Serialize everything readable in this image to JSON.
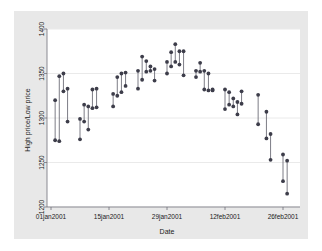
{
  "figure": {
    "background_color": "#e8e8e8",
    "plot_background_color": "#ffffff",
    "page_color": "#ffffff",
    "marker_color": "#3d3d4a",
    "line_color": "#6e6e78",
    "grid_color": "#eaeaea",
    "axis_color": "#6e6e78"
  },
  "chart_data": {
    "type": "range",
    "title": "",
    "subtitle": "",
    "xlabel": "Date",
    "ylabel": "High price/Low price",
    "grid": true,
    "grid_axis": "y",
    "legend": false,
    "legend_position": "none",
    "xlim": [
      "01jan2001",
      "28feb2001"
    ],
    "ylim": [
      1200,
      1400
    ],
    "yticks": [
      1200,
      1250,
      1300,
      1350,
      1400
    ],
    "ytick_labels": [
      "1200",
      "1250",
      "1300",
      "1350",
      "1400"
    ],
    "xticks": [
      "01jan2001",
      "15jan2001",
      "29jan2001",
      "12feb2001",
      "26feb2001"
    ],
    "xtick_labels": [
      "01jan2001",
      "15jan2001",
      "29jan2001",
      "12feb2001",
      "26feb2001"
    ],
    "series": [
      {
        "name": "High price",
        "marker": "circle"
      },
      {
        "name": "Low price",
        "marker": "circle"
      }
    ],
    "points": [
      {
        "date": "02jan2001",
        "day": 1,
        "high": 1320,
        "low": 1275
      },
      {
        "date": "03jan2001",
        "day": 2,
        "high": 1347,
        "low": 1274
      },
      {
        "date": "04jan2001",
        "day": 3,
        "high": 1350,
        "low": 1330
      },
      {
        "date": "05jan2001",
        "day": 4,
        "high": 1333,
        "low": 1296
      },
      {
        "date": "08jan2001",
        "day": 7,
        "high": 1299,
        "low": 1276
      },
      {
        "date": "09jan2001",
        "day": 8,
        "high": 1315,
        "low": 1296
      },
      {
        "date": "10jan2001",
        "day": 9,
        "high": 1313,
        "low": 1287
      },
      {
        "date": "11jan2001",
        "day": 10,
        "high": 1332,
        "low": 1311
      },
      {
        "date": "12jan2001",
        "day": 11,
        "high": 1333,
        "low": 1312
      },
      {
        "date": "16jan2001",
        "day": 15,
        "high": 1327,
        "low": 1313
      },
      {
        "date": "17jan2001",
        "day": 16,
        "high": 1346,
        "low": 1325
      },
      {
        "date": "18jan2001",
        "day": 17,
        "high": 1350,
        "low": 1329
      },
      {
        "date": "19jan2001",
        "day": 18,
        "high": 1351,
        "low": 1336
      },
      {
        "date": "22jan2001",
        "day": 21,
        "high": 1353,
        "low": 1333
      },
      {
        "date": "23jan2001",
        "day": 22,
        "high": 1369,
        "low": 1343
      },
      {
        "date": "24jan2001",
        "day": 23,
        "high": 1364,
        "low": 1352
      },
      {
        "date": "25jan2001",
        "day": 24,
        "high": 1358,
        "low": 1353
      },
      {
        "date": "26jan2001",
        "day": 25,
        "high": 1355,
        "low": 1342
      },
      {
        "date": "29jan2001",
        "day": 28,
        "high": 1363,
        "low": 1350
      },
      {
        "date": "30jan2001",
        "day": 29,
        "high": 1374,
        "low": 1358
      },
      {
        "date": "31jan2001",
        "day": 30,
        "high": 1383,
        "low": 1363
      },
      {
        "date": "01feb2001",
        "day": 31,
        "high": 1375,
        "low": 1360
      },
      {
        "date": "02feb2001",
        "day": 32,
        "high": 1375,
        "low": 1348
      },
      {
        "date": "05feb2001",
        "day": 35,
        "high": 1353,
        "low": 1346
      },
      {
        "date": "06feb2001",
        "day": 36,
        "high": 1362,
        "low": 1352
      },
      {
        "date": "07feb2001",
        "day": 37,
        "high": 1353,
        "low": 1332
      },
      {
        "date": "08feb2001",
        "day": 38,
        "high": 1350,
        "low": 1331
      },
      {
        "date": "09feb2001",
        "day": 39,
        "high": 1332,
        "low": 1331
      },
      {
        "date": "12feb2001",
        "day": 42,
        "high": 1332,
        "low": 1310
      },
      {
        "date": "13feb2001",
        "day": 43,
        "high": 1329,
        "low": 1315
      },
      {
        "date": "14feb2001",
        "day": 44,
        "high": 1322,
        "low": 1313
      },
      {
        "date": "15feb2001",
        "day": 45,
        "high": 1318,
        "low": 1304
      },
      {
        "date": "16feb2001",
        "day": 46,
        "high": 1330,
        "low": 1316
      },
      {
        "date": "20feb2001",
        "day": 50,
        "high": 1326,
        "low": 1293
      },
      {
        "date": "22feb2001",
        "day": 52,
        "high": 1307,
        "low": 1277
      },
      {
        "date": "23feb2001",
        "day": 53,
        "high": 1282,
        "low": 1253
      },
      {
        "date": "26feb2001",
        "day": 56,
        "high": 1259,
        "low": 1229
      },
      {
        "date": "27feb2001",
        "day": 57,
        "high": 1252,
        "low": 1215
      }
    ]
  }
}
